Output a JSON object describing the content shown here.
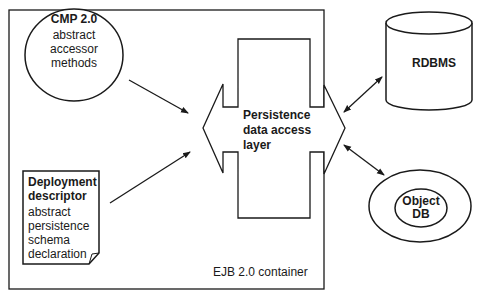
{
  "container": {
    "label": "EJB 2.0 container"
  },
  "cmp": {
    "title": "CMP 2.0",
    "lines": [
      "abstract",
      "accessor",
      "methods"
    ]
  },
  "deployment": {
    "title_line1": "Deployment",
    "title_line2": "descriptor",
    "lines": [
      "abstract",
      "persistence",
      "schema",
      "declaration"
    ]
  },
  "persistence": {
    "lines": [
      "Persistence",
      "data access",
      "layer"
    ]
  },
  "rdbms": {
    "label": "RDBMS"
  },
  "objectdb": {
    "line1": "Object",
    "line2": "DB"
  },
  "colors": {
    "stroke": "#1a1a1a",
    "background": "#ffffff"
  }
}
